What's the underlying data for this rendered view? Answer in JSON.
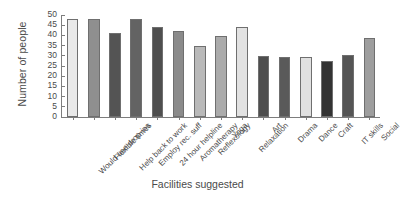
{
  "chart_data": {
    "type": "bar",
    "title": "",
    "xlabel": "Facilities suggested",
    "ylabel": "Number of people",
    "ylim": [
      0,
      50
    ],
    "ytick_step": 5,
    "yticks": [
      0,
      5,
      10,
      15,
      20,
      25,
      30,
      35,
      40,
      45,
      50
    ],
    "grid": false,
    "legend": "none",
    "xtick_rotation": -45,
    "categories": [
      "Would use drop-ins",
      "Flexible times",
      "Help back to work",
      "Employ rec. suff",
      "24 hour helpline",
      "Aromatherapy",
      "Reflexology",
      "Yoga",
      "Relaxation",
      "Art",
      "Drama",
      "Dance",
      "Craft",
      "IT skills",
      "Social"
    ],
    "values": [
      48,
      48,
      41,
      48,
      44,
      42,
      35,
      39.5,
      44,
      30,
      29.5,
      29.5,
      27.5,
      30.5,
      38.5
    ],
    "bar_colors": [
      "#e9e9e9",
      "#8f8f8f",
      "#545454",
      "#636363",
      "#4f4f4f",
      "#8b8b8b",
      "#b9b9b9",
      "#ababab",
      "#e2e2e2",
      "#4e4e4e",
      "#5a5a5a",
      "#e0e0e0",
      "#333333",
      "#555555",
      "#9e9e9e"
    ],
    "bar_edge_color": "#6f6f6f",
    "axis_color": "#7d7d7d",
    "text_color": "#4a4a4a",
    "background": "#ffffff"
  }
}
